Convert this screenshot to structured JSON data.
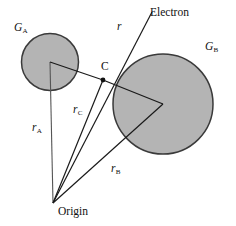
{
  "figure": {
    "type": "geometry-diagram",
    "width": 236,
    "height": 226,
    "background_color": "#ffffff",
    "stroke_color": "#1a1a1a",
    "circle_fill_color": "#b3b3b3",
    "circle_stroke_color": "#333333"
  },
  "labels": {
    "g_a": {
      "text": "G",
      "sub": "A",
      "x": 14,
      "y": 22,
      "italic": true
    },
    "g_b": {
      "text": "G",
      "sub": "B",
      "x": 205,
      "y": 41,
      "italic": true
    },
    "electron": {
      "text": "Electron",
      "x": 150,
      "y": 7,
      "italic": false
    },
    "r": {
      "text": "r",
      "x": 117,
      "y": 21,
      "italic": true
    },
    "c_point": {
      "text": "C",
      "x": 101,
      "y": 61,
      "italic": false
    },
    "r_a": {
      "text": "r",
      "sub": "A",
      "x": 32,
      "y": 122,
      "italic": true
    },
    "r_c": {
      "text": "r",
      "sub": "C",
      "x": 73,
      "y": 104,
      "italic": true
    },
    "r_b": {
      "text": "r",
      "sub": "B",
      "x": 111,
      "y": 163,
      "italic": true
    },
    "origin": {
      "text": "Origin",
      "x": 58,
      "y": 206,
      "italic": false
    }
  },
  "geometry": {
    "origin_point": {
      "x": 53,
      "y": 203
    },
    "circle_a": {
      "cx": 50,
      "cy": 62,
      "r": 29
    },
    "circle_b": {
      "cx": 163,
      "cy": 104,
      "r": 50
    },
    "point_c": {
      "x": 103,
      "y": 80,
      "dot_radius": 2.3
    },
    "electron_end": {
      "x": 152,
      "y": 12
    },
    "vectors": [
      {
        "name": "r_A",
        "from": "origin_point",
        "to": "circle_a_center"
      },
      {
        "name": "r_C",
        "from": "origin_point",
        "to": "point_c"
      },
      {
        "name": "r_B",
        "from": "origin_point",
        "to": "circle_b_center"
      },
      {
        "name": "r",
        "from": "origin_point",
        "to": "electron_end"
      }
    ],
    "connectors": [
      {
        "name": "a-center-to-c",
        "from": "circle_a_center",
        "to": "point_c"
      },
      {
        "name": "c-to-b-center",
        "from": "point_c",
        "to": "circle_b_center"
      }
    ]
  }
}
